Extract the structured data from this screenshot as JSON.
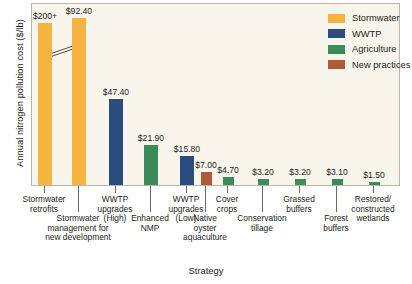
{
  "chart_data": {
    "type": "bar",
    "title": "",
    "xlabel": "Strategy",
    "ylabel": "Annual nitrogen pollution cost ($/lb)",
    "grid": false,
    "legend_position": "top-right",
    "ylim": [
      0,
      100
    ],
    "axis_break": true,
    "axis_break_note": "y-axis broken on first bar; bar extends beyond $100 to $200+",
    "categories": [
      "Stormwater retrofits",
      "Stormwater management for new development",
      "WWTP upgrades (High)",
      "Enhanced NMP",
      "WWTP upgrades (Low)",
      "Native oyster aquaculture",
      "Cover crops",
      "Conservation tillage",
      "Grassed buffers",
      "Forest buffers",
      "Restored/ constructed wetlands"
    ],
    "values": [
      200,
      92.4,
      47.4,
      21.9,
      15.8,
      7.0,
      4.7,
      3.2,
      3.2,
      3.1,
      1.5
    ],
    "value_labels": [
      "$200+",
      "$92.40",
      "$47.40",
      "$21.90",
      "$15.80",
      "$7.00",
      "$4.70",
      "$3.20",
      "$3.20",
      "$3.10",
      "$1.50"
    ],
    "series_of_point": [
      "Stormwater",
      "Stormwater",
      "WWTP",
      "Agriculture",
      "WWTP",
      "New practices",
      "Agriculture",
      "Agriculture",
      "Agriculture",
      "Agriculture",
      "Agriculture"
    ],
    "series": [
      {
        "name": "Stormwater",
        "color": "#f5b33f"
      },
      {
        "name": "WWTP",
        "color": "#2b4c7e"
      },
      {
        "name": "Agriculture",
        "color": "#3d8a5b"
      },
      {
        "name": "New practices",
        "color": "#b05a3a"
      }
    ]
  },
  "axes": {
    "y_title": "Annual nitrogen pollution cost ($/lb)",
    "x_title": "Strategy"
  },
  "legend": {
    "items": [
      {
        "label": "Stormwater",
        "color": "#f5b33f"
      },
      {
        "label": "WWTP",
        "color": "#2b4c7e"
      },
      {
        "label": "Agriculture",
        "color": "#3d8a5b"
      },
      {
        "label": "New practices",
        "color": "#b05a3a"
      }
    ]
  },
  "bars": [
    {
      "label": "$200+",
      "name": "bar-stormwater-retrofits"
    },
    {
      "label": "$92.40",
      "name": "bar-stormwater-new-development"
    },
    {
      "label": "$47.40",
      "name": "bar-wwtp-upgrades-high"
    },
    {
      "label": "$21.90",
      "name": "bar-enhanced-nmp"
    },
    {
      "label": "$15.80",
      "name": "bar-wwtp-upgrades-low"
    },
    {
      "label": "$7.00",
      "name": "bar-native-oyster-aquaculture"
    },
    {
      "label": "$4.70",
      "name": "bar-cover-crops"
    },
    {
      "label": "$3.20",
      "name": "bar-conservation-tillage"
    },
    {
      "label": "$3.20",
      "name": "bar-grassed-buffers"
    },
    {
      "label": "$3.10",
      "name": "bar-forest-buffers"
    },
    {
      "label": "$1.50",
      "name": "bar-restored-constructed-wetlands"
    }
  ],
  "xlabels": [
    {
      "text": "Stormwater\nretrofits"
    },
    {
      "text": "Stormwater\nmanagement for\nnew development"
    },
    {
      "text": "WWTP\nupgrades\n(High)"
    },
    {
      "text": "Enhanced\nNMP"
    },
    {
      "text": "WWTP\nupgrades\n(Low)"
    },
    {
      "text": "Native\noyster\naquaculture"
    },
    {
      "text": "Cover\ncrops"
    },
    {
      "text": "Conservation\ntillage"
    },
    {
      "text": "Grassed\nbuffers"
    },
    {
      "text": "Forest\nbuffers"
    },
    {
      "text": "Restored/\nconstructed\nwetlands"
    }
  ]
}
